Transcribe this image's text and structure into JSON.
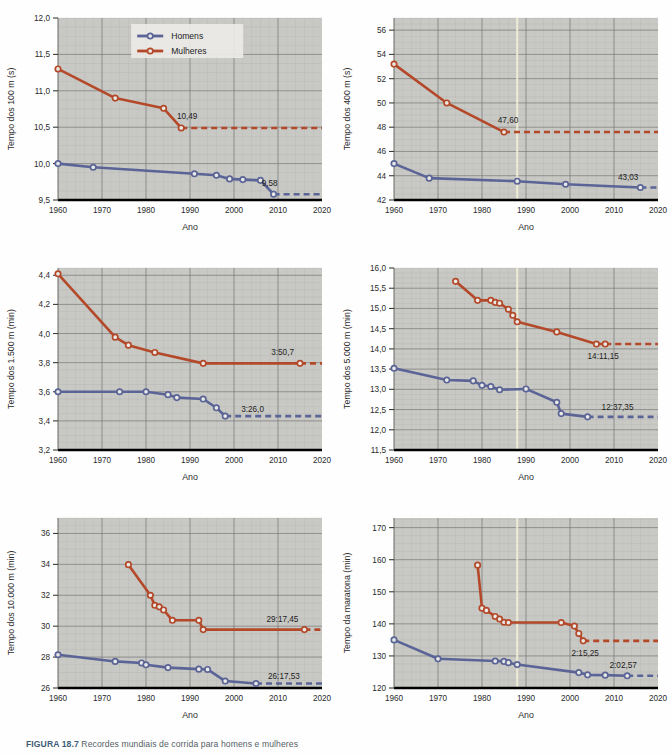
{
  "figure": {
    "caption_number": "FIGURA 18.7",
    "caption_text": "Recordes mundiais de corrida para homens e mulheres",
    "axis_x_label": "Ano",
    "legend": {
      "series_men": "Homens",
      "series_women": "Mulheres"
    },
    "colors": {
      "men": "#5a6496",
      "women": "#b4492a",
      "plot_background": "#c8c8c4",
      "grid": "#9a9a98",
      "axis_text": "#2b2b2b",
      "page_background": "#ffffff"
    }
  },
  "chart_data": [
    {
      "id": "chart-100m",
      "type": "line",
      "title": "",
      "ylabel": "Tempo dos 100 m (s)",
      "xlabel": "Ano",
      "xlim": [
        1960,
        2020
      ],
      "ylim": [
        9.5,
        12.0
      ],
      "xticks": [
        1960,
        1970,
        1980,
        1990,
        2000,
        2010,
        2020
      ],
      "yticks": [
        "9,5",
        "10,0",
        "10,5",
        "11,0",
        "11,5",
        "12,0"
      ],
      "ytick_values": [
        9.5,
        10.0,
        10.5,
        11.0,
        11.5,
        12.0
      ],
      "grid": true,
      "legend_position": "top-center",
      "series": [
        {
          "name": "Homens",
          "color": "#5a6496",
          "x": [
            1960,
            1968,
            1991,
            1996,
            1999,
            2002,
            2006,
            2009
          ],
          "y": [
            10.0,
            9.95,
            9.86,
            9.84,
            9.79,
            9.78,
            9.77,
            9.58
          ],
          "annotation": "9,58",
          "dashed_from": 2009
        },
        {
          "name": "Mulheres",
          "color": "#b4492a",
          "x": [
            1960,
            1973,
            1984,
            1988
          ],
          "y": [
            11.3,
            10.9,
            10.76,
            10.49
          ],
          "annotation": "10,49",
          "dashed_from": 1988
        }
      ]
    },
    {
      "id": "chart-400m",
      "type": "line",
      "title": "",
      "ylabel": "Tempo dos 400 m (s)",
      "xlabel": "Ano",
      "xlim": [
        1960,
        2020
      ],
      "ylim": [
        42,
        57
      ],
      "xticks": [
        1960,
        1970,
        1980,
        1990,
        2000,
        2010,
        2020
      ],
      "yticks": [
        "42",
        "44",
        "46",
        "48",
        "50",
        "52",
        "54",
        "56"
      ],
      "ytick_values": [
        42,
        44,
        46,
        48,
        50,
        52,
        54,
        56
      ],
      "grid": true,
      "legend_position": "none",
      "series": [
        {
          "name": "Homens",
          "color": "#5a6496",
          "x": [
            1960,
            1968,
            1988,
            1999,
            2016
          ],
          "y": [
            45.0,
            43.8,
            43.55,
            43.3,
            43.03
          ],
          "annotation": "43,03",
          "dashed_from": 2016
        },
        {
          "name": "Mulheres",
          "color": "#b4492a",
          "x": [
            1960,
            1972,
            1985
          ],
          "y": [
            53.2,
            50.0,
            47.6
          ],
          "annotation": "47,60",
          "dashed_from": 1985
        }
      ]
    },
    {
      "id": "chart-1500m",
      "type": "line",
      "title": "",
      "ylabel": "Tempo dos 1.500 m (min)",
      "xlabel": "Ano",
      "xlim": [
        1960,
        2020
      ],
      "ylim": [
        3.2,
        4.45
      ],
      "xticks": [
        1960,
        1970,
        1980,
        1990,
        2000,
        2010,
        2020
      ],
      "yticks": [
        "3,2",
        "3,4",
        "3,6",
        "3,8",
        "4,0",
        "4,2",
        "4,4"
      ],
      "ytick_values": [
        3.2,
        3.4,
        3.6,
        3.8,
        4.0,
        4.2,
        4.4
      ],
      "grid": true,
      "legend_position": "none",
      "series": [
        {
          "name": "Homens",
          "color": "#5a6496",
          "x": [
            1960,
            1974,
            1980,
            1985,
            1987,
            1993,
            1996,
            1998
          ],
          "y": [
            3.6,
            3.6,
            3.6,
            3.58,
            3.56,
            3.55,
            3.49,
            3.433
          ],
          "annotation": "3:26,0",
          "dashed_from": 1998
        },
        {
          "name": "Mulheres",
          "color": "#b4492a",
          "x": [
            1960,
            1973,
            1976,
            1982,
            1993,
            2015
          ],
          "y": [
            4.41,
            3.975,
            3.92,
            3.87,
            3.795,
            3.795
          ],
          "annotation": "3:50,7",
          "dashed_from": 2015
        }
      ]
    },
    {
      "id": "chart-5000m",
      "type": "line",
      "title": "",
      "ylabel": "Tempo dos 5.000 m (min)",
      "xlabel": "Ano",
      "xlim": [
        1960,
        2020
      ],
      "ylim": [
        11.5,
        16.0
      ],
      "xticks": [
        1960,
        1970,
        1980,
        1990,
        2000,
        2010,
        2020
      ],
      "yticks": [
        "11,5",
        "12,0",
        "12,5",
        "13,0",
        "13,5",
        "14,0",
        "14,5",
        "15,0",
        "15,5",
        "16,0"
      ],
      "ytick_values": [
        11.5,
        12.0,
        12.5,
        13.0,
        13.5,
        14.0,
        14.5,
        15.0,
        15.5,
        16.0
      ],
      "grid": true,
      "legend_position": "none",
      "series": [
        {
          "name": "Homens",
          "color": "#5a6496",
          "x": [
            1960,
            1972,
            1978,
            1980,
            1982,
            1984,
            1990,
            1997,
            1998,
            2004
          ],
          "y": [
            13.52,
            13.23,
            13.21,
            13.1,
            13.07,
            12.99,
            13.01,
            12.68,
            12.4,
            12.32
          ],
          "annotation": "12:37,35",
          "dashed_from": 2004
        },
        {
          "name": "Mulheres",
          "color": "#b4492a",
          "x": [
            1974,
            1979,
            1982,
            1983,
            1984,
            1986,
            1987,
            1988,
            1997,
            2006,
            2008
          ],
          "y": [
            15.67,
            15.2,
            15.2,
            15.15,
            15.13,
            14.98,
            14.83,
            14.67,
            14.42,
            14.12,
            14.12
          ],
          "annotation": "14:11,15",
          "dashed_from": 2008
        }
      ]
    },
    {
      "id": "chart-10000m",
      "type": "line",
      "title": "",
      "ylabel": "Tempo dos 10.000 m (min)",
      "xlabel": "Ano",
      "xlim": [
        1960,
        2020
      ],
      "ylim": [
        26,
        37
      ],
      "xticks": [
        1960,
        1970,
        1980,
        1990,
        2000,
        2010,
        2020
      ],
      "yticks": [
        "26",
        "28",
        "30",
        "32",
        "34",
        "36"
      ],
      "ytick_values": [
        26,
        28,
        30,
        32,
        34,
        36
      ],
      "grid": true,
      "legend_position": "none",
      "series": [
        {
          "name": "Homens",
          "color": "#5a6496",
          "x": [
            1960,
            1973,
            1979,
            1980,
            1985,
            1992,
            1994,
            1998,
            2005
          ],
          "y": [
            28.15,
            27.72,
            27.62,
            27.5,
            27.32,
            27.22,
            27.2,
            26.45,
            26.29
          ],
          "annotation": "26:17,53",
          "dashed_from": 2005
        },
        {
          "name": "Mulheres",
          "color": "#b4492a",
          "x": [
            1976,
            1981,
            1982,
            1983,
            1984,
            1986,
            1992,
            1993,
            2016
          ],
          "y": [
            33.98,
            32.0,
            31.35,
            31.25,
            31.05,
            30.38,
            30.38,
            29.78,
            29.78
          ],
          "annotation": "29:17,45",
          "dashed_from": 2016
        }
      ]
    },
    {
      "id": "chart-marathon",
      "type": "line",
      "title": "",
      "ylabel": "Tempo da maratona (min)",
      "xlabel": "Ano",
      "xlim": [
        1960,
        2020
      ],
      "ylim": [
        120,
        173
      ],
      "xticks": [
        1960,
        1970,
        1980,
        1990,
        2000,
        2010,
        2020
      ],
      "yticks": [
        "120",
        "130",
        "140",
        "150",
        "160",
        "170"
      ],
      "ytick_values": [
        120,
        130,
        140,
        150,
        160,
        170
      ],
      "grid": true,
      "legend_position": "none",
      "series": [
        {
          "name": "Homens",
          "color": "#5a6496",
          "x": [
            1960,
            1970,
            1983,
            1985,
            1986,
            1988,
            2002,
            2004,
            2008,
            2013
          ],
          "y": [
            135.0,
            129.1,
            128.4,
            128.3,
            127.9,
            127.3,
            124.8,
            124.1,
            124.0,
            123.8
          ],
          "annotation": "2:02,57",
          "dashed_from": 2013
        },
        {
          "name": "Mulheres",
          "color": "#b4492a",
          "x": [
            1979,
            1980,
            1981,
            1983,
            1984,
            1985,
            1986,
            1998,
            2001,
            2002,
            2003
          ],
          "y": [
            158.3,
            144.9,
            144.2,
            142.3,
            141.5,
            140.5,
            140.4,
            140.4,
            139.3,
            137.0,
            134.7
          ],
          "annotation": "2:15,25",
          "dashed_from": 2003
        }
      ]
    }
  ]
}
